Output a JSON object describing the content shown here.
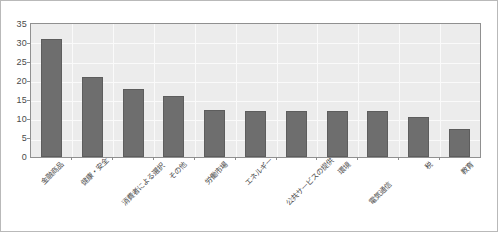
{
  "chart_data": {
    "type": "bar",
    "title": "",
    "subtitle": "",
    "xlabel": "",
    "ylabel": "",
    "ylim": [
      0,
      35
    ],
    "yticks": [
      0,
      5,
      10,
      15,
      20,
      25,
      30,
      35
    ],
    "ytick_labels": [
      "0",
      "5",
      "10",
      "15",
      "20",
      "25",
      "30",
      "35"
    ],
    "grid": true,
    "legend": false,
    "legend_position": "none",
    "orientation": "vertical",
    "bar_color": "#6e6e6e",
    "plot_background": "#ececec",
    "gridline_color": "#fafafa",
    "axis_color": "#909090",
    "categories": [
      "金融商品",
      "健康・安全",
      "消費者による選択",
      "その他",
      "労働市場",
      "エネルギー",
      "公共サービスの提供",
      "環境",
      "電気通信",
      "税",
      "教育"
    ],
    "values": [
      31,
      21,
      18,
      16,
      12.5,
      12,
      12,
      12,
      12,
      10.5,
      7.5
    ],
    "series": [
      {
        "name": "",
        "values": [
          31,
          21,
          18,
          16,
          12.5,
          12,
          12,
          12,
          12,
          10.5,
          7.5
        ]
      }
    ],
    "label_rotation": -45,
    "label_staggered": true
  }
}
